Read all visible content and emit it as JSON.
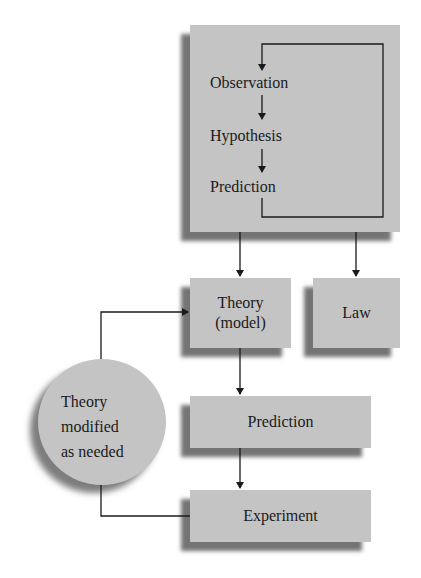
{
  "diagram": {
    "colors": {
      "box_fill": "#c4c4c4",
      "shadow": "#464646",
      "line": "#1a1a1a",
      "background": "#ffffff"
    },
    "top_box": {
      "steps": [
        "Observation",
        "Hypothesis",
        "Prediction"
      ]
    },
    "nodes": {
      "theory": {
        "line1": "Theory",
        "line2": "(model)"
      },
      "law": {
        "label": "Law"
      },
      "prediction": {
        "label": "Prediction"
      },
      "experiment": {
        "label": "Experiment"
      },
      "modified": {
        "line1": "Theory",
        "line2": "modified",
        "line3": "as needed"
      }
    },
    "edges": [
      {
        "from": "Observation",
        "to": "Hypothesis"
      },
      {
        "from": "Hypothesis",
        "to": "Prediction"
      },
      {
        "from": "Prediction",
        "to": "Observation",
        "type": "feedback loop"
      },
      {
        "from": "top_box",
        "to": "Theory (model)"
      },
      {
        "from": "top_box",
        "to": "Law"
      },
      {
        "from": "Theory (model)",
        "to": "Prediction"
      },
      {
        "from": "Prediction",
        "to": "Experiment"
      },
      {
        "from": "Experiment",
        "to": "Theory modified as needed"
      },
      {
        "from": "Theory modified as needed",
        "to": "Theory (model)"
      }
    ]
  }
}
